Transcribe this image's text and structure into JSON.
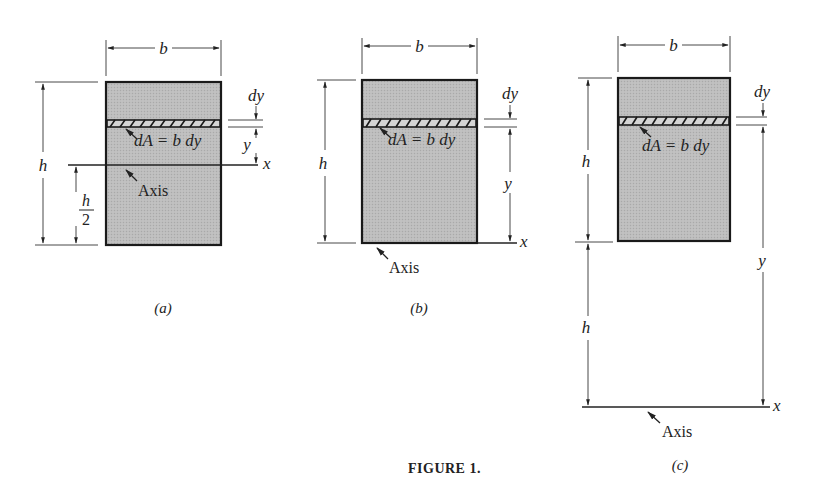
{
  "figure": {
    "caption": "FIGURE 1.",
    "colors": {
      "fill": "#bdbdbd",
      "line": "#1a1a1a",
      "background": "#ffffff"
    }
  },
  "panels": [
    {
      "id": "a",
      "label": "(a)",
      "width_label": "b",
      "height_label": "h",
      "half_height_num": "h",
      "half_height_den": "2",
      "strip_label": "dA = b dy",
      "strip_thickness_label": "dy",
      "distance_label": "y",
      "axis_label": "x",
      "axis_pointer_label": "Axis",
      "axis_position": "centroid (h/2 from base)"
    },
    {
      "id": "b",
      "label": "(b)",
      "width_label": "b",
      "height_label": "h",
      "strip_label": "dA = b dy",
      "strip_thickness_label": "dy",
      "distance_label": "y",
      "axis_label": "x",
      "axis_pointer_label": "Axis",
      "axis_position": "base"
    },
    {
      "id": "c",
      "label": "(c)",
      "width_label": "b",
      "height_label": "h",
      "offset_label": "h",
      "strip_label": "dA = b dy",
      "strip_thickness_label": "dy",
      "distance_label": "y",
      "axis_label": "x",
      "axis_pointer_label": "Axis",
      "axis_position": "h below base"
    }
  ]
}
